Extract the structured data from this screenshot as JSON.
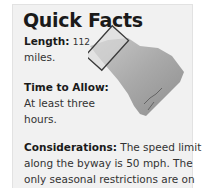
{
  "panel": {
    "title": "Quick Facts",
    "length": {
      "label": "Length:",
      "value": "112",
      "unit": "miles."
    },
    "time_to_allow": {
      "label": "Time to Allow:",
      "line1": "At least three",
      "line2": "hours."
    },
    "considerations": {
      "label": "Considerations:",
      "line1_rest": " The speed limit",
      "line2": "along the byway is 50 mph. The",
      "line3": "only seasonal restrictions are on"
    },
    "map": {
      "icon": "south-carolina-map-icon",
      "highlight": "byway-region-outline"
    }
  },
  "colors": {
    "panel_bg": "#f1f1f1",
    "map_fill": "#a8a8a8",
    "outline": "#3a3a3a",
    "text": "#333333"
  }
}
